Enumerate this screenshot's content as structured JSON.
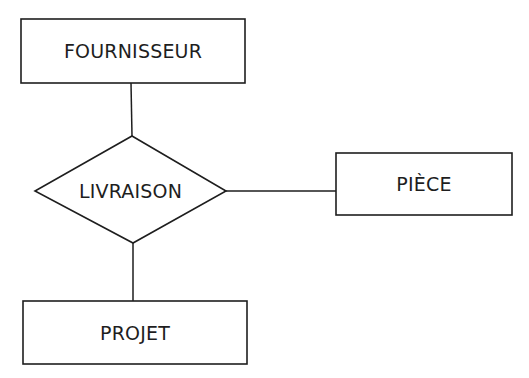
{
  "diagram": {
    "type": "entity-relationship",
    "stroke_color": "#1e1e1e",
    "background": "#ffffff",
    "entities": [
      {
        "id": "fournisseur",
        "label": "FOURNISSEUR"
      },
      {
        "id": "piece",
        "label": "PIÈCE"
      },
      {
        "id": "projet",
        "label": "PROJET"
      }
    ],
    "relationships": [
      {
        "id": "livraison",
        "label": "LIVRAISON",
        "connects": [
          "fournisseur",
          "piece",
          "projet"
        ]
      }
    ]
  }
}
